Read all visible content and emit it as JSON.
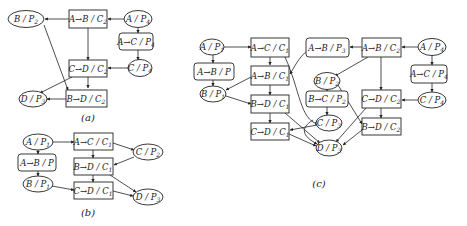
{
  "diagrams": {
    "a": {
      "caption": "(a)",
      "nodes": {
        "B_P2": {
          "label": "B / P",
          "sub": "2",
          "shape": "ellipse"
        },
        "AB_C2": {
          "label": "A→B / C",
          "sub": "2",
          "shape": "box"
        },
        "A_P4": {
          "label": "A / P",
          "sub": "4",
          "shape": "ellipse"
        },
        "AC_P4": {
          "label": "A→C / P",
          "sub": "4",
          "shape": "rounded-box"
        },
        "CD_C2": {
          "label": "C→D / C",
          "sub": "2",
          "shape": "box"
        },
        "C_P4": {
          "label": "C / P",
          "sub": "4",
          "shape": "ellipse"
        },
        "D_P3": {
          "label": "D / P",
          "sub": "3",
          "shape": "ellipse"
        },
        "BD_C2": {
          "label": "B→D / C",
          "sub": "2",
          "shape": "box"
        }
      },
      "edges": [
        [
          "AB_C2",
          "B_P2"
        ],
        [
          "A_P4",
          "AB_C2"
        ],
        [
          "A_P4",
          "AC_P4"
        ],
        [
          "AC_P4",
          "C_P4"
        ],
        [
          "AB_C2",
          "CD_C2"
        ],
        [
          "C_P4",
          "CD_C2"
        ],
        [
          "CD_C2",
          "BD_C2"
        ],
        [
          "CD_C2",
          "D_P3"
        ],
        [
          "B_P2",
          "BD_C2"
        ],
        [
          "BD_C2",
          "D_P3"
        ]
      ]
    },
    "b": {
      "caption": "(b)",
      "nodes": {
        "A_P1": {
          "label": "A / P",
          "sub": "1",
          "shape": "ellipse"
        },
        "AC_C1": {
          "label": "A→C / C",
          "sub": "1",
          "shape": "box"
        },
        "C_P2": {
          "label": "C / P",
          "sub": "2",
          "shape": "ellipse"
        },
        "AB_P": {
          "label": "A→B / P",
          "sub": "",
          "shape": "rounded-box"
        },
        "BD_C1": {
          "label": "B→D / C",
          "sub": "1",
          "shape": "box"
        },
        "B_P1": {
          "label": "B / P",
          "sub": "1",
          "shape": "ellipse"
        },
        "CD_C1": {
          "label": "C→D / C",
          "sub": "1",
          "shape": "box"
        },
        "D_P3": {
          "label": "D / P",
          "sub": "3",
          "shape": "ellipse"
        }
      },
      "edges": [
        [
          "A_P1",
          "AC_C1"
        ],
        [
          "A_P1",
          "AB_P"
        ],
        [
          "AB_P",
          "B_P1"
        ],
        [
          "AC_C1",
          "C_P2"
        ],
        [
          "AC_C1",
          "BD_C1"
        ],
        [
          "C_P2",
          "BD_C1"
        ],
        [
          "BD_C1",
          "CD_C1"
        ],
        [
          "BD_C1",
          "D_P3"
        ],
        [
          "B_P1",
          "CD_C1"
        ],
        [
          "CD_C1",
          "D_P3"
        ]
      ]
    },
    "c": {
      "caption": "(c)",
      "nodes": {
        "A_P1": {
          "label": "A / P",
          "sub": "1",
          "shape": "ellipse"
        },
        "AC_C1": {
          "label": "A→C / C",
          "sub": "1",
          "shape": "box"
        },
        "AB_P3": {
          "label": "A→B / P",
          "sub": "3",
          "shape": "rounded-box"
        },
        "AB_C2": {
          "label": "A→B / C",
          "sub": "2",
          "shape": "box"
        },
        "A_P4": {
          "label": "A / P",
          "sub": "4",
          "shape": "ellipse"
        },
        "AB_P": {
          "label": "A→B / P",
          "sub": "",
          "shape": "rounded-box"
        },
        "AB_C1": {
          "label": "A→B / C",
          "sub": "1",
          "shape": "box"
        },
        "B_P2": {
          "label": "B / P",
          "sub": "2",
          "shape": "ellipse"
        },
        "AC_P4": {
          "label": "A→C / P",
          "sub": "4",
          "shape": "rounded-box"
        },
        "B_P1": {
          "label": "B / P",
          "sub": "1",
          "shape": "ellipse"
        },
        "BC_P2": {
          "label": "B→C / P",
          "sub": "2",
          "shape": "rounded-box"
        },
        "CD_C2": {
          "label": "C→D / C",
          "sub": "2",
          "shape": "box"
        },
        "C_P4": {
          "label": "C / P",
          "sub": "4",
          "shape": "ellipse"
        },
        "BD_C1": {
          "label": "B→D / C",
          "sub": "1",
          "shape": "box"
        },
        "C_P3": {
          "label": "C / P",
          "sub": "3",
          "shape": "ellipse"
        },
        "BD_C2": {
          "label": "B→D / C",
          "sub": "2",
          "shape": "box"
        },
        "CD_C1": {
          "label": "C→D / C",
          "sub": "1",
          "shape": "box"
        },
        "D_P3": {
          "label": "D / P",
          "sub": "3",
          "shape": "ellipse"
        }
      },
      "edges": [
        [
          "A_P1",
          "AC_C1"
        ],
        [
          "A_P1",
          "AB_P"
        ],
        [
          "AB_P",
          "B_P1"
        ],
        [
          "AC_C1",
          "AB_C1"
        ],
        [
          "AC_C1",
          "C_P3"
        ],
        [
          "AB_P3",
          "AB_C1"
        ],
        [
          "AB_C2",
          "AB_P3"
        ],
        [
          "AB_C2",
          "B_P2"
        ],
        [
          "A_P4",
          "AB_C2"
        ],
        [
          "A_P4",
          "AC_P4"
        ],
        [
          "AC_P4",
          "C_P4"
        ],
        [
          "AB_C1",
          "B_P1"
        ],
        [
          "AB_C1",
          "BD_C1"
        ],
        [
          "B_P2",
          "BC_P2"
        ],
        [
          "B_P2",
          "BD_C2"
        ],
        [
          "BC_P2",
          "C_P3"
        ],
        [
          "AB_C2",
          "CD_C2"
        ],
        [
          "C_P4",
          "CD_C2"
        ],
        [
          "CD_C2",
          "BD_C2"
        ],
        [
          "CD_C2",
          "D_P3"
        ],
        [
          "B_P1",
          "BD_C1"
        ],
        [
          "BD_C1",
          "CD_C1"
        ],
        [
          "BD_C1",
          "D_P3"
        ],
        [
          "C_P3",
          "CD_C1"
        ],
        [
          "C_P3",
          "D_P3"
        ],
        [
          "CD_C1",
          "D_P3"
        ],
        [
          "BD_C2",
          "D_P3"
        ]
      ]
    }
  }
}
